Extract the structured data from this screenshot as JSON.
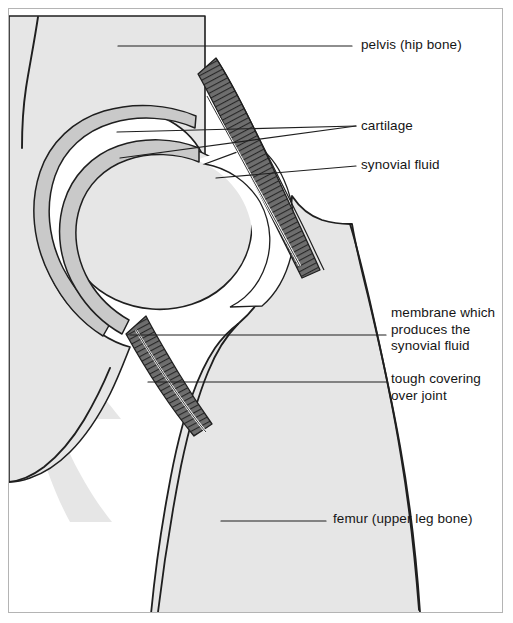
{
  "figure": {
    "background_color": "#ffffff",
    "frame_color": "#b4b4b4",
    "bone_fill_color": "#e6e6e6",
    "outline_color": "#1f1f1f",
    "cartilage_fill_color": "#c9c9c9",
    "capsule_fill_color": "#5a5a5a",
    "cavity_fill_color": "#ffffff",
    "leader_line_color": "#1f1f1f",
    "text_color": "#151515"
  },
  "labels": {
    "pelvis": "pelvis (hip bone)",
    "cartilage": "cartilage",
    "synovial_fluid": "synovial fluid",
    "membrane": "membrane which\nproduces the\nsynovial fluid",
    "tough_covering": "tough covering\nover joint",
    "femur": "femur (upper leg bone)"
  },
  "structures": [
    {
      "name": "pelvis",
      "label": "pelvis (hip bone)",
      "region": "upper-left"
    },
    {
      "name": "acetabular-cartilage",
      "label": "cartilage",
      "region": "socket-lining"
    },
    {
      "name": "femoral-head-cartilage",
      "label": "cartilage",
      "region": "ball-lining"
    },
    {
      "name": "synovial-cavity",
      "label": "synovial fluid",
      "region": "joint-space"
    },
    {
      "name": "synovial-membrane",
      "label": "membrane which produces the synovial fluid",
      "region": "capsule-inner"
    },
    {
      "name": "joint-capsule",
      "label": "tough covering over joint",
      "region": "capsule-outer"
    },
    {
      "name": "femur",
      "label": "femur (upper leg bone)",
      "region": "lower-right"
    }
  ]
}
